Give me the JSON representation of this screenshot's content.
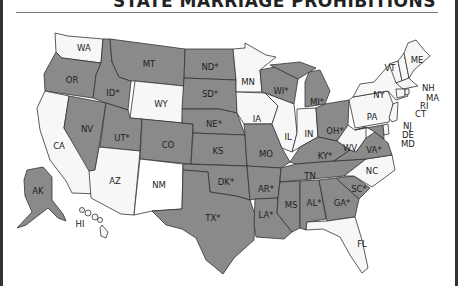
{
  "header": {
    "title": "STATE MARRIAGE PROHIBITIONS"
  },
  "legend_colors": {
    "prohibited": "#8a8a8a",
    "not_prohibited": "#f7f7f7",
    "border": "#333333"
  },
  "map": {
    "asterisk_note": "* marker shown next to some state abbreviations",
    "states": [
      {
        "abbr": "WA",
        "label": "WA",
        "shade": "light"
      },
      {
        "abbr": "OR",
        "label": "OR",
        "shade": "dark"
      },
      {
        "abbr": "CA",
        "label": "CA",
        "shade": "light"
      },
      {
        "abbr": "NV",
        "label": "NV",
        "shade": "dark"
      },
      {
        "abbr": "ID",
        "label": "ID*",
        "shade": "dark"
      },
      {
        "abbr": "MT",
        "label": "MT",
        "shade": "dark"
      },
      {
        "abbr": "WY",
        "label": "WY",
        "shade": "light"
      },
      {
        "abbr": "UT",
        "label": "UT*",
        "shade": "dark"
      },
      {
        "abbr": "AZ",
        "label": "AZ",
        "shade": "light"
      },
      {
        "abbr": "CO",
        "label": "CO",
        "shade": "dark"
      },
      {
        "abbr": "NM",
        "label": "NM",
        "shade": "white"
      },
      {
        "abbr": "ND",
        "label": "ND*",
        "shade": "dark"
      },
      {
        "abbr": "SD",
        "label": "SD*",
        "shade": "dark"
      },
      {
        "abbr": "NE",
        "label": "NE*",
        "shade": "dark"
      },
      {
        "abbr": "KS",
        "label": "KS",
        "shade": "dark"
      },
      {
        "abbr": "OK",
        "label": "DK*",
        "shade": "dark"
      },
      {
        "abbr": "TX",
        "label": "TX*",
        "shade": "dark"
      },
      {
        "abbr": "MN",
        "label": "MN",
        "shade": "light"
      },
      {
        "abbr": "IA",
        "label": "IA",
        "shade": "light"
      },
      {
        "abbr": "MO",
        "label": "MO",
        "shade": "dark"
      },
      {
        "abbr": "AR",
        "label": "AR*",
        "shade": "dark"
      },
      {
        "abbr": "LA",
        "label": "LA*",
        "shade": "dark"
      },
      {
        "abbr": "WI",
        "label": "WI*",
        "shade": "dark"
      },
      {
        "abbr": "IL",
        "label": "IL",
        "shade": "light"
      },
      {
        "abbr": "MI",
        "label": "MI*",
        "shade": "dark"
      },
      {
        "abbr": "IN",
        "label": "IN",
        "shade": "light"
      },
      {
        "abbr": "OH",
        "label": "OH*",
        "shade": "dark"
      },
      {
        "abbr": "KY",
        "label": "KY*",
        "shade": "dark"
      },
      {
        "abbr": "TN",
        "label": "TN",
        "shade": "dark"
      },
      {
        "abbr": "MS",
        "label": "MS",
        "shade": "dark"
      },
      {
        "abbr": "AL",
        "label": "AL*",
        "shade": "dark"
      },
      {
        "abbr": "GA",
        "label": "GA*",
        "shade": "dark"
      },
      {
        "abbr": "FL",
        "label": "FL",
        "shade": "light"
      },
      {
        "abbr": "SC",
        "label": "SC*",
        "shade": "dark"
      },
      {
        "abbr": "NC",
        "label": "NC",
        "shade": "light"
      },
      {
        "abbr": "VA",
        "label": "VA*",
        "shade": "dark"
      },
      {
        "abbr": "WV",
        "label": "WV",
        "shade": "light"
      },
      {
        "abbr": "PA",
        "label": "PA",
        "shade": "light"
      },
      {
        "abbr": "NY",
        "label": "NY",
        "shade": "light"
      },
      {
        "abbr": "VT",
        "label": "VT",
        "shade": "light"
      },
      {
        "abbr": "NH",
        "label": "NH",
        "shade": "light"
      },
      {
        "abbr": "ME",
        "label": "ME",
        "shade": "light"
      },
      {
        "abbr": "MA",
        "label": "MA",
        "shade": "light"
      },
      {
        "abbr": "RI",
        "label": "RI",
        "shade": "light"
      },
      {
        "abbr": "CT",
        "label": "CT",
        "shade": "light"
      },
      {
        "abbr": "NJ",
        "label": "NJ",
        "shade": "light"
      },
      {
        "abbr": "DE",
        "label": "DE",
        "shade": "light"
      },
      {
        "abbr": "MD",
        "label": "MD",
        "shade": "dark"
      },
      {
        "abbr": "AK",
        "label": "AK",
        "shade": "dark"
      },
      {
        "abbr": "HI",
        "label": "HI",
        "shade": "light"
      }
    ]
  }
}
